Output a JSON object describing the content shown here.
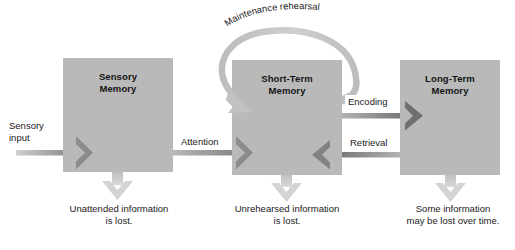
{
  "diagram": {
    "colors": {
      "box_fill": "#b9b9b9",
      "arrow_gray_dark": "#6e6e6e",
      "arrow_gray_light": "#c9c9c9",
      "loop_arrow": "#c2c2c2",
      "text": "#1a1a1a",
      "background": "#ffffff"
    },
    "stores": [
      {
        "id": "sensory",
        "label": "Sensory\nMemory"
      },
      {
        "id": "short",
        "label": "Short-Term\nMemory"
      },
      {
        "id": "long",
        "label": "Long-Term\nMemory"
      }
    ],
    "flows": [
      {
        "id": "sensory-input",
        "label": "Sensory\ninput",
        "direction": "right"
      },
      {
        "id": "attention",
        "label": "Attention",
        "direction": "right"
      },
      {
        "id": "encoding",
        "label": "Encoding",
        "direction": "right"
      },
      {
        "id": "retrieval",
        "label": "Retrieval",
        "direction": "left"
      },
      {
        "id": "rehearsal",
        "label": "Maintenance rehearsal",
        "direction": "loop"
      }
    ],
    "losses": [
      {
        "id": "sensory-loss",
        "label": "Unattended information\nis lost."
      },
      {
        "id": "short-loss",
        "label": "Unrehearsed information\nis lost."
      },
      {
        "id": "long-loss",
        "label": "Some information\nmay be lost over time."
      }
    ]
  }
}
